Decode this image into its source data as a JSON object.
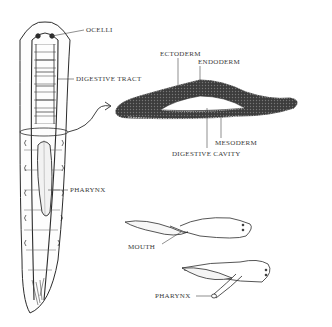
{
  "figure": {
    "colors": {
      "ink": "#2b2b2b",
      "label": "#3a3a3a",
      "fill_dark": "#3c3c3c",
      "background": "#ffffff"
    },
    "whole_body": {
      "labels": {
        "ocelli": "OCELLI",
        "digestive_tract": "DIGESTIVE TRACT",
        "pharynx": "PHARYNX"
      }
    },
    "cross_section": {
      "labels": {
        "ectoderm": "ECTODERM",
        "endoderm": "ENDODERM",
        "mesoderm": "MESODERM",
        "digestive_cavity": "DIGESTIVE CAVITY"
      }
    },
    "feeding_views": {
      "top": {
        "label": "MOUTH"
      },
      "bottom": {
        "label": "PHARYNX"
      }
    }
  }
}
